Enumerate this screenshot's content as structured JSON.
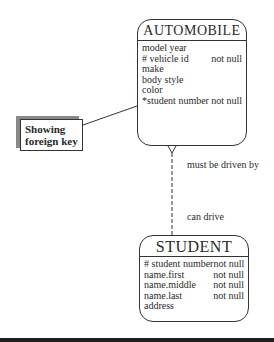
{
  "entities": {
    "automobile": {
      "title": "AUTOMOBILE",
      "attributes": [
        {
          "name": "model year",
          "constraint": ""
        },
        {
          "name": "# vehicle id",
          "constraint": "not null"
        },
        {
          "name": "make",
          "constraint": ""
        },
        {
          "name": "body style",
          "constraint": ""
        },
        {
          "name": "color",
          "constraint": ""
        },
        {
          "name": "*student number",
          "constraint": "not null"
        }
      ]
    },
    "student": {
      "title": "STUDENT",
      "attributes": [
        {
          "name": "# student number",
          "constraint": "not null"
        },
        {
          "name": "name.first",
          "constraint": "not null"
        },
        {
          "name": "name.middle",
          "constraint": "not null"
        },
        {
          "name": "name.last",
          "constraint": "not null"
        },
        {
          "name": "address",
          "constraint": ""
        }
      ]
    }
  },
  "relationship": {
    "automobile_side_label": "must be driven by",
    "student_side_label": "can drive"
  },
  "callout": {
    "line1": "Showing",
    "line2": "foreign key"
  },
  "colors": {
    "line": "#333333",
    "shadow": "#888888",
    "bottom_bar": "#1e1e1e"
  }
}
